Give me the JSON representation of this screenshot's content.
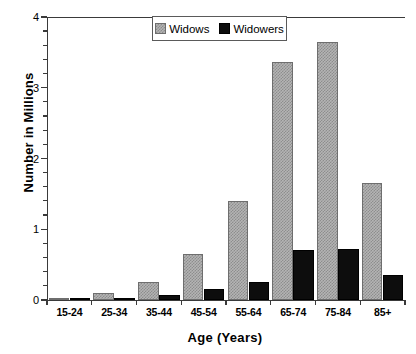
{
  "chart_data": {
    "type": "bar",
    "title": "",
    "xlabel": "Age (Years)",
    "ylabel": "Number in Millions",
    "categories": [
      "15-24",
      "25-34",
      "35-44",
      "45-54",
      "55-64",
      "65-74",
      "75-84",
      "85+"
    ],
    "series": [
      {
        "name": "Widows",
        "color": "#b4b4b4",
        "values": [
          0.02,
          0.1,
          0.26,
          0.65,
          1.4,
          3.37,
          3.65,
          1.65
        ]
      },
      {
        "name": "Widowers",
        "color": "#0d0d0d",
        "values": [
          0.01,
          0.02,
          0.07,
          0.15,
          0.26,
          0.7,
          0.72,
          0.35
        ]
      }
    ],
    "ylim": [
      0,
      4
    ],
    "ytick_labels": [
      "0",
      "1",
      "2",
      "3",
      "4"
    ],
    "ytick_values": [
      0,
      1,
      2,
      3,
      4
    ],
    "yminor_step": 0.2,
    "grid": false,
    "legend_position": "top-center",
    "legend_boxed": true
  },
  "axes": {
    "y_title": "Number in Millions",
    "x_title": "Age (Years)"
  },
  "legend": {
    "entries": [
      {
        "label": "Widows"
      },
      {
        "label": "Widowers"
      }
    ]
  }
}
